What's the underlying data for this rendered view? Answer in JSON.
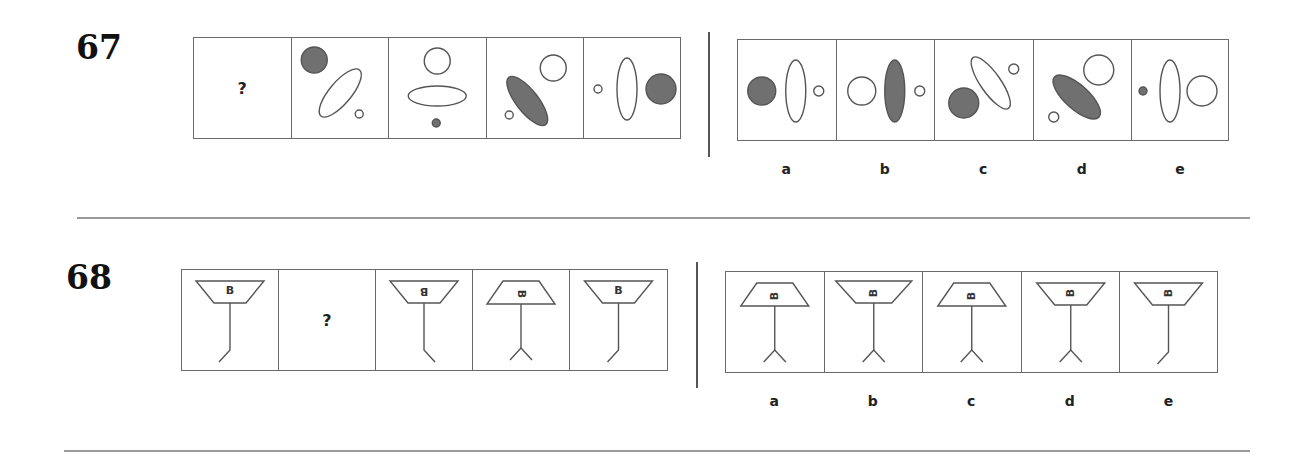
{
  "colors": {
    "stroke": "#555555",
    "fill_dark": "#707070",
    "border": "#6a6a6a",
    "rule": "#9a9a9a"
  },
  "puzzles": [
    {
      "number": "67",
      "question_mark": "?",
      "question_cells": [
        {
          "type": "unknown",
          "label": "?"
        },
        {
          "type": "shapes",
          "shapes": [
            {
              "kind": "circle",
              "cx": 22,
              "cy": 22,
              "r": 13,
              "fill": "dark"
            },
            {
              "kind": "ellipse",
              "cx": 48,
              "cy": 55,
              "rx": 30,
              "ry": 11,
              "rot": -50,
              "fill": "none"
            },
            {
              "kind": "circle",
              "cx": 67,
              "cy": 76,
              "r": 4,
              "fill": "none"
            }
          ]
        },
        {
          "type": "shapes",
          "shapes": [
            {
              "kind": "circle",
              "cx": 48,
              "cy": 23,
              "r": 13,
              "fill": "none"
            },
            {
              "kind": "ellipse",
              "cx": 48,
              "cy": 58,
              "rx": 29,
              "ry": 10,
              "rot": 0,
              "fill": "none"
            },
            {
              "kind": "circle",
              "cx": 47,
              "cy": 85,
              "r": 4,
              "fill": "dark"
            }
          ]
        },
        {
          "type": "shapes",
          "shapes": [
            {
              "kind": "ellipse",
              "cx": 40,
              "cy": 63,
              "rx": 30,
              "ry": 11,
              "rot": 52,
              "fill": "dark"
            },
            {
              "kind": "circle",
              "cx": 66,
              "cy": 30,
              "r": 13,
              "fill": "none"
            },
            {
              "kind": "circle",
              "cx": 22,
              "cy": 77,
              "r": 4,
              "fill": "none"
            }
          ]
        },
        {
          "type": "shapes",
          "shapes": [
            {
              "kind": "circle",
              "cx": 14,
              "cy": 51,
              "r": 4,
              "fill": "none"
            },
            {
              "kind": "ellipse",
              "cx": 43,
              "cy": 51,
              "rx": 10,
              "ry": 31,
              "rot": 0,
              "fill": "none"
            },
            {
              "kind": "circle",
              "cx": 77,
              "cy": 51,
              "r": 15,
              "fill": "dark"
            }
          ]
        }
      ],
      "answer_cells": [
        {
          "label": "a",
          "shapes": [
            {
              "kind": "circle",
              "cx": 23,
              "cy": 51,
              "r": 14,
              "fill": "dark"
            },
            {
              "kind": "ellipse",
              "cx": 57,
              "cy": 51,
              "rx": 10,
              "ry": 31,
              "rot": 0,
              "fill": "none"
            },
            {
              "kind": "circle",
              "cx": 80,
              "cy": 51,
              "r": 5,
              "fill": "none"
            }
          ]
        },
        {
          "label": "b",
          "shapes": [
            {
              "kind": "circle",
              "cx": 24,
              "cy": 51,
              "r": 14,
              "fill": "none"
            },
            {
              "kind": "ellipse",
              "cx": 57,
              "cy": 51,
              "rx": 10,
              "ry": 31,
              "rot": 0,
              "fill": "dark"
            },
            {
              "kind": "circle",
              "cx": 82,
              "cy": 51,
              "r": 5,
              "fill": "none"
            }
          ]
        },
        {
          "label": "c",
          "shapes": [
            {
              "kind": "circle",
              "cx": 28,
              "cy": 63,
              "r": 15,
              "fill": "dark"
            },
            {
              "kind": "ellipse",
              "cx": 55,
              "cy": 43,
              "rx": 31,
              "ry": 10,
              "rot": 55,
              "fill": "none"
            },
            {
              "kind": "circle",
              "cx": 78,
              "cy": 29,
              "r": 5,
              "fill": "none"
            }
          ]
        },
        {
          "label": "d",
          "shapes": [
            {
              "kind": "ellipse",
              "cx": 42,
              "cy": 57,
              "rx": 30,
              "ry": 12,
              "rot": 42,
              "fill": "dark"
            },
            {
              "kind": "circle",
              "cx": 64,
              "cy": 30,
              "r": 15,
              "fill": "none"
            },
            {
              "kind": "circle",
              "cx": 19,
              "cy": 77,
              "r": 5,
              "fill": "none"
            }
          ]
        },
        {
          "label": "e",
          "shapes": [
            {
              "kind": "circle",
              "cx": 11,
              "cy": 51,
              "r": 4,
              "fill": "dark"
            },
            {
              "kind": "ellipse",
              "cx": 38,
              "cy": 51,
              "rx": 10,
              "ry": 31,
              "rot": 0,
              "fill": "none"
            },
            {
              "kind": "circle",
              "cx": 70,
              "cy": 51,
              "r": 15,
              "fill": "none"
            }
          ]
        }
      ]
    },
    {
      "number": "68",
      "question_mark": "?",
      "question_cells": [
        {
          "type": "figure",
          "shade": "inverted",
          "letter": "B",
          "letter_rot": 0,
          "foot": "bent"
        },
        {
          "type": "unknown",
          "label": "?"
        },
        {
          "type": "figure",
          "shade": "inverted",
          "letter": "B",
          "letter_rot": 180,
          "foot": "bent-right"
        },
        {
          "type": "figure",
          "shade": "upright",
          "letter": "B",
          "letter_rot": 90,
          "foot": "forked"
        },
        {
          "type": "figure",
          "shade": "inverted",
          "letter": "B",
          "letter_rot": 0,
          "foot": "bent"
        }
      ],
      "answer_cells": [
        {
          "label": "a",
          "shade": "upright",
          "letter": "B",
          "letter_rot": -90,
          "foot": "forked"
        },
        {
          "label": "b",
          "shade": "inverted-wide",
          "letter": "B",
          "letter_rot": -90,
          "foot": "forked"
        },
        {
          "label": "c",
          "shade": "upright",
          "letter": "B",
          "letter_rot": -90,
          "foot": "forked"
        },
        {
          "label": "d",
          "shade": "inverted",
          "letter": "B",
          "letter_rot": -90,
          "foot": "forked"
        },
        {
          "label": "e",
          "shade": "inverted",
          "letter": "B",
          "letter_rot": -90,
          "foot": "bent"
        }
      ]
    }
  ]
}
